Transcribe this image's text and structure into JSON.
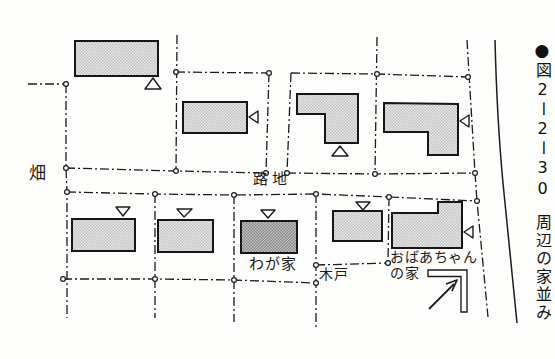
{
  "caption": {
    "bullet": "●",
    "figure_number": "図2ー2ー30",
    "title": "周辺の家並み"
  },
  "map_labels": {
    "field": "畑",
    "alley": "路地",
    "my_house": "わが家",
    "gate": "木戸",
    "grandma_house": "おばあちゃん\nの家"
  },
  "houses": [
    {
      "id": 1,
      "block": "upper",
      "shape": "rect",
      "shade": "light",
      "entrance_marker": "up-triangle-below"
    },
    {
      "id": 2,
      "block": "upper",
      "shape": "rect",
      "shade": "light",
      "entrance_marker": "left-triangle-at-right"
    },
    {
      "id": 3,
      "block": "upper",
      "shape": "L",
      "shade": "light",
      "entrance_marker": "up-triangle-below"
    },
    {
      "id": 4,
      "block": "upper",
      "shape": "L",
      "shade": "light",
      "entrance_marker": "left-triangle-at-right"
    },
    {
      "id": 5,
      "block": "lower",
      "shape": "rect",
      "shade": "light",
      "entrance_marker": "down-triangle-above"
    },
    {
      "id": 6,
      "block": "lower",
      "shape": "rect",
      "shade": "light",
      "entrance_marker": "down-triangle-above"
    },
    {
      "id": 7,
      "block": "lower",
      "shape": "rect",
      "shade": "dark",
      "entrance_marker": "down-triangle-above",
      "label": "わが家"
    },
    {
      "id": 8,
      "block": "lower",
      "shape": "rect",
      "shade": "light",
      "entrance_marker": "down-triangle-above"
    },
    {
      "id": 9,
      "block": "lower",
      "shape": "L",
      "shade": "light",
      "entrance_marker": "left-triangle-at-right",
      "label": "おばあちゃんの家"
    }
  ],
  "markers": {
    "entrance_up": "△",
    "entrance_down": "▽",
    "entrance_left": "◁",
    "plot_node": "circle",
    "corner_arrow": "arrow-to-upper-right"
  },
  "colors": {
    "line": "#1c1c1c",
    "house_fill_light": "#d9d9d9",
    "house_fill_dark": "#a8a8a8",
    "background": "#fdfdfb"
  }
}
